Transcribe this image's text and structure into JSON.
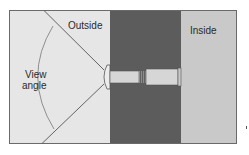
{
  "diagram": {
    "type": "peephole-view-angle",
    "labels": {
      "outside": "Outside",
      "inside": "Inside",
      "view_angle_line1": "View",
      "view_angle_line2": "angle"
    },
    "regions": [
      {
        "name": "outside",
        "color": "#e6e6e6"
      },
      {
        "name": "wall",
        "color": "#5c5c5c"
      },
      {
        "name": "inside",
        "color": "#c9c9c9"
      }
    ],
    "parts": {
      "lens": "wide-angle-lens",
      "tube_outer": "narrow-barrel",
      "tube_inner": "eyepiece-barrel",
      "thread": "threaded-joint"
    },
    "colors": {
      "frame": "#6a6a6a",
      "lines": "#555555",
      "tube_fill": "#d6d6d6",
      "lens_fill": "#ececec"
    }
  }
}
